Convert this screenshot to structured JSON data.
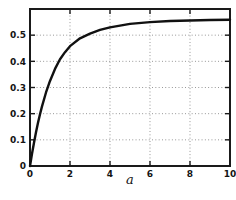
{
  "figure": {
    "background": "#ffffff",
    "frame_color": "#1a1a1a",
    "grid_color": "#808080",
    "curve_color": "#111111"
  },
  "chart_data": {
    "type": "line",
    "title": "",
    "xlabel": "a",
    "ylabel": "",
    "xlim": [
      0,
      10
    ],
    "ylim": [
      0,
      0.6
    ],
    "xticks": [
      0,
      2,
      4,
      6,
      8,
      10
    ],
    "xtick_labels": [
      "0",
      "2",
      "4",
      "6",
      "8",
      "10"
    ],
    "yticks": [
      0,
      0.1,
      0.2,
      0.3,
      0.4,
      0.5
    ],
    "ytick_labels": [
      "0",
      "0.1",
      "0.2",
      "0.3",
      "0.4",
      "0.5"
    ],
    "grid": "dotted gridlines at every labeled tick, ticks inward on all four box edges",
    "legend": "none",
    "series": [
      {
        "name": "saturating-curve",
        "x": [
          0,
          0.1,
          0.2,
          0.3,
          0.4,
          0.5,
          0.6,
          0.8,
          1.0,
          1.25,
          1.5,
          1.75,
          2.0,
          2.5,
          3.0,
          3.5,
          4.0,
          5.0,
          6.0,
          7.0,
          8.0,
          9.0,
          10.0
        ],
        "y": [
          0,
          0.047,
          0.089,
          0.129,
          0.165,
          0.198,
          0.228,
          0.281,
          0.325,
          0.371,
          0.408,
          0.435,
          0.458,
          0.488,
          0.506,
          0.52,
          0.53,
          0.543,
          0.55,
          0.554,
          0.556,
          0.558,
          0.559
        ]
      }
    ]
  }
}
